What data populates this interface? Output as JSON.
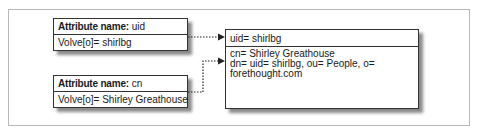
{
  "attribute_boxes": [
    {
      "name_label": "Attribute name:",
      "name_value": "uid",
      "value_line": "Volve[o]= shirlbg"
    },
    {
      "name_label": "Attribute name:",
      "name_value": "cn",
      "value_line": "Volve[o]= Shirley Greathouse"
    }
  ],
  "entry_box": {
    "header": "uid= shirlbg",
    "lines": [
      "cn= Shirley Greathouse",
      "dn= uid= shirlbg, ou= People, o= forethought.com"
    ]
  },
  "colors": {
    "border": "#333333",
    "shadow": "#8a8a8a",
    "frame": "#b8b8b8"
  }
}
